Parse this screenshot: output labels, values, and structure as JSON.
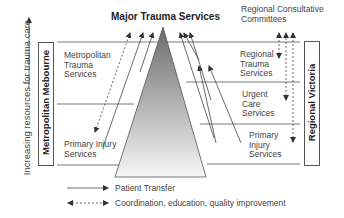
{
  "diagram": {
    "title": "Major Trauma Services",
    "y_axis_label": "Increasing resources for trauma care",
    "left_region": "Metropolitan Mebourne",
    "right_region": "Regional Victoria",
    "regional_committees": [
      "Regional Consultative",
      "Committees"
    ],
    "metro_services": [
      {
        "id": "metro-trauma",
        "lines": [
          "Metropolitan",
          "Trauma",
          "Services"
        ]
      },
      {
        "id": "metro-primary",
        "lines": [
          "Primary Injury",
          "Services"
        ]
      }
    ],
    "regional_services": [
      {
        "id": "regional-trauma",
        "lines": [
          "Regional",
          "Trauma",
          "Services"
        ]
      },
      {
        "id": "urgent-care",
        "lines": [
          "Urgent",
          "Care",
          "Services"
        ]
      },
      {
        "id": "regional-primary",
        "lines": [
          "Primary",
          "Injury",
          "Services"
        ]
      }
    ],
    "legend": [
      {
        "style": "solid",
        "label": "Patient Transfer"
      },
      {
        "style": "dashed-double",
        "label": "Coordination, education, quality improvement"
      }
    ],
    "colors": {
      "line": "#555555",
      "pyramid_top": "#6a6a6a",
      "pyramid_bottom": "#f4f4f4"
    }
  }
}
